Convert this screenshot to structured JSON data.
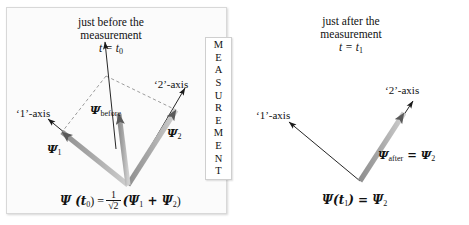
{
  "figure": {
    "type": "physics-diagram",
    "topic": "quantum measurement state-vector collapse"
  },
  "left_panel": {
    "heading_line1": "just before the",
    "heading_line2": "measurement",
    "time_label": "t = t",
    "time_sub": "0",
    "axis1_label": "‘1’-axis",
    "axis2_label": "‘2’-axis",
    "vec_psi1": "Ψ",
    "vec_psi1_sub": "1",
    "vec_psi2": "Ψ",
    "vec_psi2_sub": "2",
    "vec_before": "Ψ",
    "vec_before_sub": "before",
    "equation": {
      "lhs": "Ψ (t",
      "lhs_sub": "0",
      "lhs_tail": ") =",
      "frac_num": "1",
      "frac_den": "√2",
      "rhs_open": "(Ψ",
      "rhs_sub1": "1",
      "rhs_plus": " + Ψ",
      "rhs_sub2": "2",
      "rhs_close": ")"
    }
  },
  "measurement_box": {
    "letters": [
      "M",
      "E",
      "A",
      "S",
      "U",
      "R",
      "E",
      "M",
      "E",
      "N",
      "T"
    ],
    "word": "MEASUREMENT"
  },
  "right_panel": {
    "heading_line1": "just after the",
    "heading_line2": "measurement",
    "time_label": "t = t",
    "time_sub": "1",
    "axis1_label": "‘1’-axis",
    "axis2_label": "‘2’-axis",
    "vec_after": "Ψ",
    "vec_after_sub": "after",
    "vec_after_eq": " = Ψ",
    "vec_after_eq_sub": "2",
    "equation": {
      "lhs": "Ψ(t",
      "lhs_sub": "1",
      "lhs_tail": ") = Ψ",
      "rhs_sub": "2"
    }
  },
  "colors": {
    "vector_fill": "#9a9a9a",
    "vector_fill_light": "#b5b5b5",
    "arrowhead": "#4a4a4a",
    "axis_line": "#1a1a1a",
    "dashed": "#7a7a7a",
    "panel_bg": "#fbfbfb",
    "page_bg": "#ffffff"
  }
}
